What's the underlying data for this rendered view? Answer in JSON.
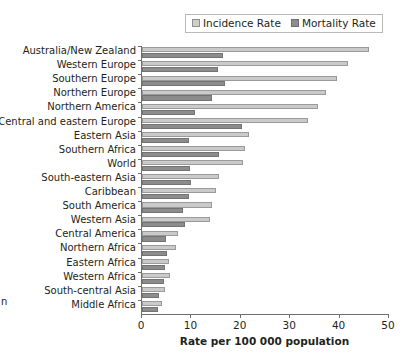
{
  "legend": {
    "position": "top-right",
    "entries": [
      {
        "label": "Incidence Rate",
        "icon": "square-swatch-light",
        "color": "#cacaca"
      },
      {
        "label": "Mortality Rate",
        "icon": "square-swatch-dark",
        "color": "#8c8c8c"
      }
    ]
  },
  "axis": {
    "xlabel": "Rate per 100 000 population",
    "ticks": [
      "0",
      "10",
      "20",
      "30",
      "40",
      "50"
    ]
  },
  "edge_fragment": "n",
  "chart_data": {
    "type": "bar",
    "orientation": "horizontal",
    "title": "",
    "subtitle": "",
    "xlabel": "Rate per 100 000 population",
    "ylabel": "",
    "xlim": [
      0,
      50
    ],
    "xticks": [
      0,
      10,
      20,
      30,
      40,
      50
    ],
    "grid": false,
    "legend_position": "top-right",
    "categories": [
      "Australia/New Zealand",
      "Western Europe",
      "Southern Europe",
      "Northern Europe",
      "Northern America",
      "Central and eastern Europe",
      "Eastern Asia",
      "Southern Africa",
      "World",
      "South-eastern Asia",
      "Caribbean",
      "South America",
      "Western Asia",
      "Central America",
      "Northern Africa",
      "Eastern Africa",
      "Western Africa",
      "South-central Asia",
      "Middle Africa"
    ],
    "series": [
      {
        "name": "Incidence Rate",
        "color": "#cacaca",
        "values": [
          46.0,
          41.6,
          39.4,
          37.3,
          35.7,
          33.6,
          21.7,
          20.9,
          20.5,
          15.6,
          14.9,
          14.1,
          13.7,
          7.3,
          6.9,
          5.4,
          5.7,
          4.6,
          4.0
        ]
      },
      {
        "name": "Mortality Rate",
        "color": "#8c8c8c",
        "values": [
          16.4,
          15.4,
          16.8,
          14.1,
          10.7,
          20.3,
          9.5,
          15.6,
          9.8,
          10.0,
          9.5,
          8.2,
          8.7,
          4.9,
          5.1,
          4.6,
          4.4,
          3.5,
          3.3
        ]
      }
    ]
  }
}
